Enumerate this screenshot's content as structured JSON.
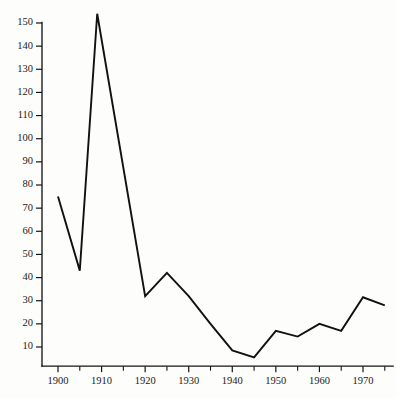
{
  "chart_data": {
    "type": "line",
    "title": "",
    "subtitle": "",
    "xlabel": "",
    "ylabel": "",
    "xlim": [
      1897,
      1976
    ],
    "ylim": [
      0,
      158
    ],
    "grid": false,
    "legend": null,
    "legend_position": "none",
    "line_color": "#111111",
    "background_color": "#fdfdfb",
    "axis_color": "#141414",
    "x": [
      1900,
      1905,
      1909,
      1920,
      1925,
      1930,
      1935,
      1940,
      1945,
      1950,
      1955,
      1960,
      1965,
      1970,
      1975
    ],
    "values": [
      75,
      43,
      154,
      32,
      42,
      32,
      20,
      8.5,
      5.5,
      17,
      14.5,
      20,
      17,
      31.5,
      28
    ],
    "series": [
      {
        "name": "series-1",
        "values": [
          75,
          43,
          154,
          32,
          42,
          32,
          20,
          8.5,
          5.5,
          17,
          14.5,
          20,
          17,
          31.5,
          28
        ]
      }
    ],
    "yticks": [
      10,
      20,
      30,
      40,
      50,
      60,
      70,
      80,
      90,
      100,
      110,
      120,
      130,
      140,
      150
    ],
    "ytick_labels": [
      "10",
      "20",
      "30",
      "40",
      "50",
      "60",
      "70",
      "80",
      "90",
      "100",
      "110",
      "120",
      "130",
      "140",
      "150"
    ],
    "xticks": [
      1900,
      1910,
      1920,
      1930,
      1940,
      1950,
      1960,
      1970
    ],
    "xtick_labels": [
      "1900",
      "1910",
      "1920",
      "1930",
      "1940",
      "1950",
      "1960",
      "1970"
    ],
    "x_minor_ticks": [
      1905,
      1915,
      1925,
      1935,
      1945,
      1955,
      1965,
      1975
    ],
    "annotations": []
  }
}
